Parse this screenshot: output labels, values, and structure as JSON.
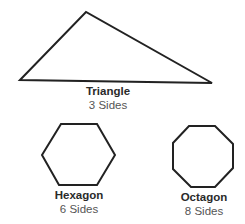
{
  "stroke_color": "#222222",
  "shapes": [
    {
      "name": "Triangle",
      "sides_label": "3 Sides",
      "sides": 3
    },
    {
      "name": "Hexagon",
      "sides_label": "6 Sides",
      "sides": 6
    },
    {
      "name": "Octagon",
      "sides_label": "8 Sides",
      "sides": 8
    }
  ]
}
